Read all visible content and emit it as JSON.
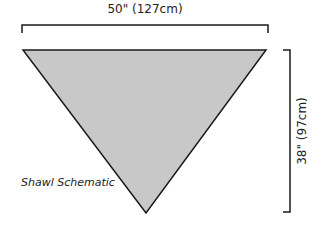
{
  "diagram": {
    "title": "Shawl Schematic",
    "shape": "inverted-triangle",
    "width_label": "50\" (127cm)",
    "height_label": "38\" (97cm)",
    "colors": {
      "fill": "#c8c8c8",
      "stroke": "#1a1a1a"
    }
  }
}
